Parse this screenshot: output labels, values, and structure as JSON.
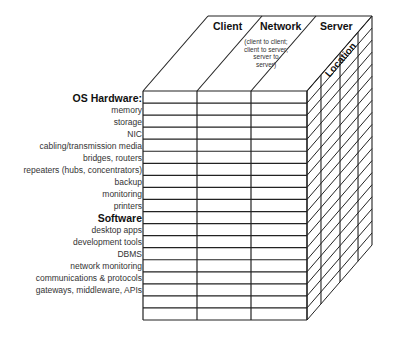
{
  "columns": [
    {
      "label": "Client",
      "note": ""
    },
    {
      "label": "Network",
      "note": "(client to client; client to server; server to server)"
    },
    {
      "label": "Server",
      "note": ""
    }
  ],
  "depth_axis_label": "Location",
  "rows": [
    {
      "label": "OS Hardware:",
      "heading": true
    },
    {
      "label": "memory",
      "heading": false
    },
    {
      "label": "storage",
      "heading": false
    },
    {
      "label": "NIC",
      "heading": false
    },
    {
      "label": "cabling/transmission media",
      "heading": false
    },
    {
      "label": "bridges, routers",
      "heading": false
    },
    {
      "label": "repeaters (hubs, concentrators)",
      "heading": false
    },
    {
      "label": "backup",
      "heading": false
    },
    {
      "label": "monitoring",
      "heading": false
    },
    {
      "label": "printers",
      "heading": false
    },
    {
      "label": "Software",
      "heading": true
    },
    {
      "label": "desktop apps",
      "heading": false
    },
    {
      "label": "development tools",
      "heading": false
    },
    {
      "label": "DBMS",
      "heading": false
    },
    {
      "label": "network monitoring",
      "heading": false
    },
    {
      "label": "communications & protocols",
      "heading": false
    },
    {
      "label": "gateways, middleware, APIs",
      "heading": false
    }
  ],
  "grid": {
    "row_count": 19,
    "column_count": 3,
    "depth_slices": 4,
    "line_color": "#222222"
  }
}
